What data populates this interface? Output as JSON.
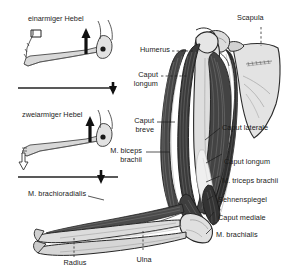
{
  "figure": {
    "title_left_top": "einarmiger Hebel",
    "title_left_bottom": "zweiarmiger Hebel",
    "background_color": "#ffffff",
    "bone_color": "#d9d9d9",
    "muscle_color": "#3a3a3a",
    "outline_color": "#1a1a1a"
  },
  "labels": {
    "scapula": "Scapula",
    "humerus": "Humerus",
    "caput_longum_biceps": "Caput\nlongum",
    "caput_breve": "Caput\nbreve",
    "m_biceps_brachii": "M. biceps\nbrachii",
    "m_brachioradialis": "M. brachioradialis",
    "caput_laterale": "Caput laterale",
    "caput_longum_triceps": "Caput longum",
    "m_triceps_brachii": "M. triceps brachii",
    "sehnenspiegel": "Sehnenspiegel",
    "caput_mediale": "Caput mediale",
    "m_brachialis": "M. brachialis",
    "radius": "Radius",
    "ulna": "Ulna"
  },
  "icons": {
    "force_arrow": "force-arrow-icon",
    "load_arrow": "load-arrow-icon",
    "fulcrum": "fulcrum-pivot-icon"
  }
}
